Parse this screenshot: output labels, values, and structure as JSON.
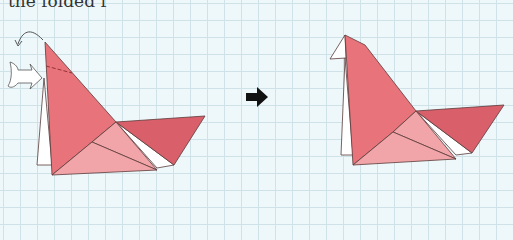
{
  "caption": "the folded f",
  "colors": {
    "background": "#eef8fa",
    "grid": "#cfe2e8",
    "body_main": "#e8737a",
    "body_light": "#f2a5a8",
    "tail": "#d9606b",
    "outline": "#5a3a3a",
    "back_flap": "#ffffff",
    "arrow": "#111111"
  },
  "figures": [
    {
      "name": "before",
      "description": "Origami bird with head to be folded back (curved arrow) and pushed in (hollow arrow); dashed fold line near top"
    },
    {
      "name": "after",
      "description": "Origami bird with head folded, small white flap at top left"
    }
  ],
  "step_arrow": "right-arrow"
}
